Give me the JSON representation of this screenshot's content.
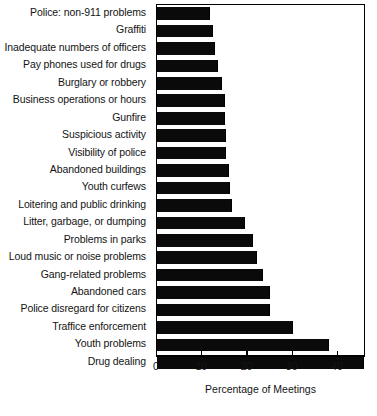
{
  "chart_data": {
    "type": "bar",
    "orientation": "horizontal",
    "title": "",
    "subtitle": "",
    "xlabel": "Percentage of Meetings",
    "ylabel": "",
    "xlim": [
      0,
      46.2
    ],
    "xticks": [
      0,
      10,
      20,
      30,
      40
    ],
    "xtick_labels": [
      "0",
      "10",
      "20",
      "30",
      "40"
    ],
    "grid": false,
    "legend": null,
    "bar_color": "#0a0a0a",
    "categories": [
      "Police: non-911 problems",
      "Graffiti",
      "Inadequate numbers of officers",
      "Pay phones used for drugs",
      "Burglary or robbery",
      "Business operations or hours",
      "Gunfire",
      "Suspicious activity",
      "Visibility of police",
      "Abandoned buildings",
      "Youth curfews",
      "Loitering and public drinking",
      "Litter, garbage, or dumping",
      "Problems in parks",
      "Loud music or noise problems",
      "Gang-related problems",
      "Abandoned cars",
      "Police disregard for citizens",
      "Traffice enforcement",
      "Youth problems",
      "Drug dealing"
    ],
    "values": [
      11.6,
      12.2,
      12.7,
      13.3,
      14.2,
      14.7,
      14.9,
      15.0,
      15.1,
      15.6,
      16.0,
      16.4,
      19.3,
      21.1,
      21.8,
      23.3,
      24.7,
      24.7,
      29.9,
      37.8,
      45.6
    ]
  },
  "axis": {
    "x_title": "Percentage of Meetings"
  }
}
